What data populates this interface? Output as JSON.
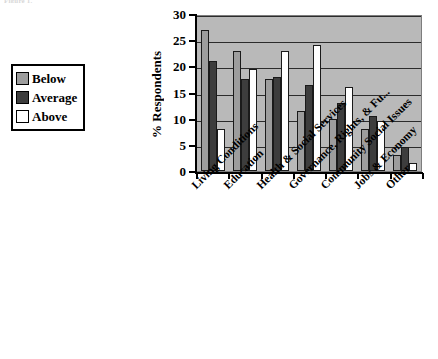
{
  "figure": {
    "caption_remnant": "Figure 1.",
    "y_axis_title": "% Respondents"
  },
  "legend": {
    "items": [
      {
        "label": "Below",
        "color": "#9d9d9d",
        "swatch_name": "legend-swatch-below"
      },
      {
        "label": "Average",
        "color": "#3d3d3d",
        "swatch_name": "legend-swatch-average"
      },
      {
        "label": "Above",
        "color": "#ffffff",
        "swatch_name": "legend-swatch-above"
      }
    ]
  },
  "axis": {
    "y_ticks": [
      "30",
      "25",
      "20",
      "15",
      "10",
      "5",
      "0"
    ]
  },
  "chart_data": {
    "type": "bar",
    "title": "",
    "subtitle": "",
    "xlabel": "",
    "ylabel": "% Respondents",
    "ylim": [
      0,
      30
    ],
    "ytick_step": 5,
    "grid": true,
    "grid_axis": "y",
    "legend_position": "left-outside",
    "categories": [
      "Living Conditions",
      "Education",
      "Health & Social Services",
      "Governance, Rights, & Fu...",
      "Community Social Issues",
      "Jobs & Economy",
      "Other"
    ],
    "series": [
      {
        "name": "Below",
        "color": "#9d9d9d",
        "values": [
          27,
          23,
          17.5,
          11.5,
          10,
          8,
          3
        ]
      },
      {
        "name": "Average",
        "color": "#3d3d3d",
        "values": [
          21,
          17.5,
          18,
          16.5,
          13,
          10.5,
          4.5
        ]
      },
      {
        "name": "Above",
        "color": "#ffffff",
        "values": [
          8,
          19.5,
          23,
          24,
          16,
          9.5,
          1.5
        ]
      }
    ]
  }
}
